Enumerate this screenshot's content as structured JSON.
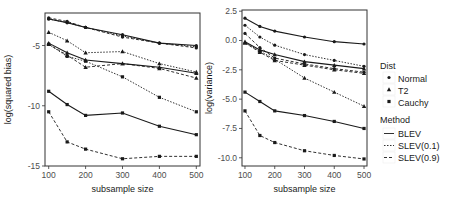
{
  "chart_data": [
    {
      "type": "line",
      "title": "",
      "xlabel": "subsample size",
      "ylabel": "log(squared bias)",
      "x": [
        100,
        150,
        200,
        300,
        400,
        500
      ],
      "xticks": [
        100,
        200,
        300,
        400,
        500
      ],
      "xtick_labels": [
        "100",
        "200",
        "300",
        "400",
        "500"
      ],
      "xlim": [
        90,
        510
      ],
      "ylim": [
        -15,
        -2.3
      ],
      "yticks": [
        -5,
        -10,
        -15
      ],
      "ytick_labels": [
        "-5",
        "-10",
        "-15"
      ],
      "grid": false,
      "series": [
        {
          "name": "Normal BLEV",
          "dist": "Normal",
          "method": "BLEV",
          "values": [
            -2.8,
            -3.1,
            -3.5,
            -4.1,
            -4.8,
            -5.0
          ]
        },
        {
          "name": "Normal SLEV(0.1)",
          "dist": "Normal",
          "method": "SLEV(0.1)",
          "values": [
            -2.8,
            -3.1,
            -3.5,
            -4.2,
            -4.8,
            -5.1
          ]
        },
        {
          "name": "Normal SLEV(0.9)",
          "dist": "Normal",
          "method": "SLEV(0.9)",
          "values": [
            -2.7,
            -3.0,
            -3.5,
            -4.3,
            -4.8,
            -5.2
          ]
        },
        {
          "name": "T2 BLEV",
          "dist": "T2",
          "method": "BLEV",
          "values": [
            -4.8,
            -5.6,
            -6.2,
            -6.5,
            -6.8,
            -7.3
          ]
        },
        {
          "name": "T2 SLEV(0.1)",
          "dist": "T2",
          "method": "SLEV(0.1)",
          "values": [
            -3.9,
            -4.6,
            -5.6,
            -5.5,
            -6.5,
            -7.2
          ]
        },
        {
          "name": "T2 SLEV(0.9)",
          "dist": "T2",
          "method": "SLEV(0.9)",
          "values": [
            -4.9,
            -5.8,
            -6.8,
            -6.5,
            -6.9,
            -7.7
          ]
        },
        {
          "name": "Cauchy BLEV",
          "dist": "Cauchy",
          "method": "BLEV",
          "values": [
            -8.8,
            -9.9,
            -10.8,
            -10.6,
            -11.7,
            -12.4
          ]
        },
        {
          "name": "Cauchy SLEV(0.1)",
          "dist": "Cauchy",
          "method": "SLEV(0.1)",
          "values": [
            -4.9,
            -5.9,
            -6.3,
            -7.6,
            -9.3,
            -10.5
          ]
        },
        {
          "name": "Cauchy SLEV(0.9)",
          "dist": "Cauchy",
          "method": "SLEV(0.9)",
          "values": [
            -10.5,
            -13.0,
            -13.6,
            -14.4,
            -14.2,
            -14.2
          ]
        }
      ]
    },
    {
      "type": "line",
      "title": "",
      "xlabel": "subsample size",
      "ylabel": "log(variance)",
      "x": [
        100,
        150,
        200,
        300,
        400,
        500
      ],
      "xticks": [
        100,
        200,
        300,
        400,
        500
      ],
      "xtick_labels": [
        "100",
        "200",
        "300",
        "400",
        "500"
      ],
      "xlim": [
        90,
        510
      ],
      "ylim": [
        -10.7,
        2.6
      ],
      "yticks": [
        2.5,
        0.0,
        -2.5,
        -5.0,
        -7.5,
        -10.0
      ],
      "ytick_labels": [
        "2.5",
        "0.0",
        "-2.5",
        "-5.0",
        "-7.5",
        "-10.0"
      ],
      "grid": false,
      "series": [
        {
          "name": "Normal BLEV",
          "dist": "Normal",
          "method": "BLEV",
          "values": [
            1.9,
            1.2,
            0.8,
            0.3,
            -0.1,
            -0.3
          ]
        },
        {
          "name": "Normal SLEV(0.1)",
          "dist": "Normal",
          "method": "SLEV(0.1)",
          "values": [
            1.3,
            0.3,
            -0.4,
            -1.2,
            -1.7,
            -2.2
          ]
        },
        {
          "name": "Normal SLEV(0.9)",
          "dist": "Normal",
          "method": "SLEV(0.9)",
          "values": [
            0.6,
            -0.6,
            -1.5,
            -2.0,
            -2.4,
            -2.7
          ]
        },
        {
          "name": "T2 BLEV",
          "dist": "T2",
          "method": "BLEV",
          "values": [
            -0.1,
            -0.8,
            -1.2,
            -1.8,
            -2.1,
            -2.4
          ]
        },
        {
          "name": "T2 SLEV(0.1)",
          "dist": "T2",
          "method": "SLEV(0.1)",
          "values": [
            -0.2,
            -0.9,
            -1.6,
            -3.2,
            -4.4,
            -5.6
          ]
        },
        {
          "name": "T2 SLEV(0.9)",
          "dist": "T2",
          "method": "SLEV(0.9)",
          "values": [
            -0.2,
            -1.0,
            -1.7,
            -2.1,
            -2.5,
            -2.8
          ]
        },
        {
          "name": "Cauchy BLEV",
          "dist": "Cauchy",
          "method": "BLEV",
          "values": [
            -4.4,
            -5.2,
            -6.0,
            -6.4,
            -6.9,
            -7.5
          ]
        },
        {
          "name": "Cauchy SLEV(0.9)",
          "dist": "Cauchy",
          "method": "SLEV(0.9)",
          "values": [
            -6.0,
            -8.1,
            -8.7,
            -9.4,
            -9.8,
            -10.1
          ]
        }
      ]
    }
  ],
  "legend": {
    "position": "right",
    "dist_title": "Dist",
    "dist_items": [
      {
        "label": "Normal",
        "marker": "circle"
      },
      {
        "label": "T2",
        "marker": "triangle"
      },
      {
        "label": "Cauchy",
        "marker": "square"
      }
    ],
    "method_title": "Method",
    "method_items": [
      {
        "label": "BLEV",
        "linetype": "solid"
      },
      {
        "label": "SLEV(0.1)",
        "linetype": "dotted"
      },
      {
        "label": "SLEV(0.9)",
        "linetype": "dashed"
      }
    ]
  },
  "colors": {
    "line": "#1a1a1a",
    "axis": "#333333",
    "tick_text": "#4d4d4d"
  }
}
